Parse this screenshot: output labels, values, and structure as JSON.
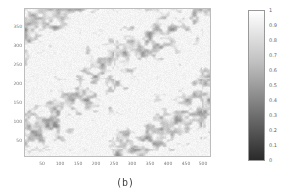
{
  "chart_data": {
    "type": "heatmap",
    "title": "",
    "caption": "(b)",
    "xlabel": "",
    "ylabel": "",
    "x_ticks": [
      50,
      100,
      150,
      200,
      250,
      300,
      350,
      400,
      450,
      500
    ],
    "y_ticks": [
      50,
      100,
      150,
      200,
      250,
      300,
      350
    ],
    "xlim": [
      0,
      520
    ],
    "ylim": [
      0,
      390
    ],
    "colormap": "gray",
    "colorbar": {
      "range": [
        0,
        1
      ],
      "ticks": [
        "0",
        "0.1",
        "0.2",
        "0.3",
        "0.4",
        "0.5",
        "0.6",
        "0.7",
        "0.8",
        "0.9",
        "1"
      ],
      "position": "right"
    },
    "value_distribution": "mostly high values (0.75-1, near white) with diagonal streaky gray clusters (0.5-0.75) running from lower-left to upper-right",
    "grid": false
  },
  "colors": {
    "frame": "#bdbdbd",
    "tick_text": "#777777",
    "cbar_top": "#ffffff",
    "cbar_bottom": "#2a2a2a"
  }
}
